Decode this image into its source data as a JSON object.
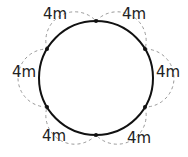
{
  "diagram": {
    "circle": {
      "cx": 96,
      "cy": 78,
      "r": 57,
      "stroke": "#111111"
    },
    "dashed_stroke": "#999999",
    "points": [
      {
        "x": 96,
        "y": 21
      },
      {
        "x": 145,
        "y": 49
      },
      {
        "x": 145,
        "y": 107
      },
      {
        "x": 96,
        "y": 135
      },
      {
        "x": 47,
        "y": 107
      },
      {
        "x": 47,
        "y": 49
      }
    ],
    "labels": [
      {
        "text": "4m",
        "position": "top-left"
      },
      {
        "text": "4m",
        "position": "top-right"
      },
      {
        "text": "4m",
        "position": "left"
      },
      {
        "text": "4m",
        "position": "right"
      },
      {
        "text": "4m",
        "position": "bottom-left"
      },
      {
        "text": "4m",
        "position": "bottom-right"
      }
    ]
  }
}
